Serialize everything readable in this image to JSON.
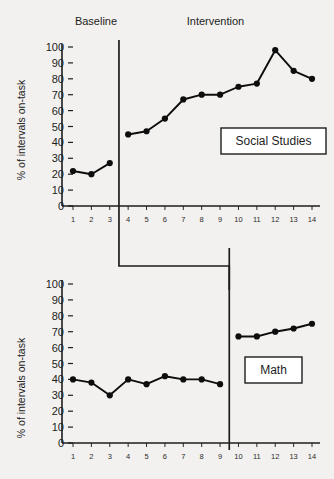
{
  "figure": {
    "background_color": "#f2f1ef",
    "line_color": "#0d0d0d",
    "marker_color": "#0d0d0d",
    "axis_color": "#1d1d1d"
  },
  "chart_data": [
    {
      "type": "line",
      "title": "Social Studies",
      "condition_label": "Social Studies",
      "xlabel": "",
      "ylabel": "% of intervals on-task",
      "ylim": [
        0,
        100
      ],
      "ytick_labels": [
        "0",
        "10",
        "20",
        "30",
        "40",
        "50",
        "60",
        "70",
        "80",
        "90",
        "100"
      ],
      "yticks": [
        0,
        10,
        20,
        30,
        40,
        50,
        60,
        70,
        80,
        90,
        100
      ],
      "xlim": [
        1,
        14
      ],
      "xtick_labels": [
        "1",
        "2",
        "3",
        "4",
        "5",
        "6",
        "7",
        "8",
        "9",
        "10",
        "11",
        "12",
        "13",
        "14"
      ],
      "xticks": [
        1,
        2,
        3,
        4,
        5,
        6,
        7,
        8,
        9,
        10,
        11,
        12,
        13,
        14
      ],
      "grid": false,
      "legend": "none",
      "phase_line_after_x": 3,
      "phase_labels": [
        "Baseline",
        "Intervention"
      ],
      "series": [
        {
          "name": "Baseline",
          "x": [
            1,
            2,
            3
          ],
          "values": [
            22,
            20,
            27
          ]
        },
        {
          "name": "Intervention",
          "x": [
            4,
            5,
            6,
            7,
            8,
            9,
            10,
            11,
            12,
            13,
            14
          ],
          "values": [
            45,
            47,
            55,
            67,
            70,
            70,
            75,
            77,
            98,
            85,
            80
          ]
        }
      ]
    },
    {
      "type": "line",
      "title": "Math",
      "condition_label": "Math",
      "xlabel": "",
      "ylabel": "% of intervals on-task",
      "ylim": [
        0,
        100
      ],
      "ytick_labels": [
        "0",
        "10",
        "20",
        "30",
        "40",
        "50",
        "60",
        "70",
        "80",
        "90",
        "100"
      ],
      "yticks": [
        0,
        10,
        20,
        30,
        40,
        50,
        60,
        70,
        80,
        90,
        100
      ],
      "xlim": [
        1,
        14
      ],
      "xtick_labels": [
        "1",
        "2",
        "3",
        "4",
        "5",
        "6",
        "7",
        "8",
        "9",
        "10",
        "11",
        "12",
        "13",
        "14"
      ],
      "xticks": [
        1,
        2,
        3,
        4,
        5,
        6,
        7,
        8,
        9,
        10,
        11,
        12,
        13,
        14
      ],
      "grid": false,
      "legend": "none",
      "phase_line_after_x": 9,
      "phase_labels": [],
      "series": [
        {
          "name": "Baseline",
          "x": [
            1,
            2,
            3,
            4,
            5,
            6,
            7,
            8,
            9
          ],
          "values": [
            40,
            38,
            30,
            40,
            37,
            42,
            40,
            40,
            37
          ]
        },
        {
          "name": "Intervention",
          "x": [
            10,
            11,
            12,
            13,
            14
          ],
          "values": [
            67,
            67,
            70,
            72,
            75
          ]
        }
      ]
    }
  ]
}
